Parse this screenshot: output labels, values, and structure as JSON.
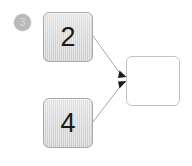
{
  "diagram": {
    "canvas": {
      "width": 192,
      "height": 166,
      "background": "#ffffff"
    },
    "step_badge": {
      "label": "3",
      "name": "step-number-badge",
      "circle_color": "#b9b9b9",
      "text_color": "#dedede"
    },
    "nodes": [
      {
        "id": "node-a",
        "name": "node-value-2",
        "label": "2",
        "style": "filled",
        "fill_color": "#d6d6d6",
        "border_color": "#a9a9a9",
        "text_color": "#1a1a1a"
      },
      {
        "id": "node-b",
        "name": "node-value-4",
        "label": "4",
        "style": "filled",
        "fill_color": "#d6d6d6",
        "border_color": "#a9a9a9",
        "text_color": "#1a1a1a"
      },
      {
        "id": "node-c",
        "name": "node-result-empty",
        "label": "",
        "style": "empty",
        "fill_color": "#ffffff",
        "border_color": "#c3c3c3",
        "text_color": "#1a1a1a"
      }
    ],
    "edges": [
      {
        "name": "edge-from-2-to-result",
        "from": "node-a",
        "to": "node-c",
        "line_color": "#a8a8a8",
        "arrow_color": "#1a1a1a"
      },
      {
        "name": "edge-from-4-to-result",
        "from": "node-b",
        "to": "node-c",
        "line_color": "#a8a8a8",
        "arrow_color": "#1a1a1a"
      }
    ]
  }
}
